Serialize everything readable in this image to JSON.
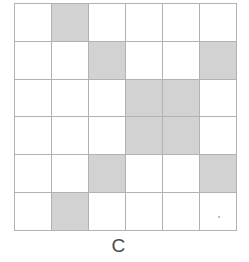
{
  "figure": {
    "caption": "C",
    "type": "shaded-grid",
    "rows": 6,
    "columns": 6,
    "colors": {
      "shaded_cell": "#d2d2d2",
      "empty_cell": "#ffffff",
      "grid_line": "#b2b2b2",
      "caption_text": "#4a4a4a",
      "background": "#ffffff"
    },
    "shaded_count": 10,
    "grid": [
      [
        0,
        1,
        0,
        0,
        0,
        0
      ],
      [
        0,
        0,
        1,
        0,
        0,
        1
      ],
      [
        0,
        0,
        0,
        1,
        1,
        0
      ],
      [
        0,
        0,
        0,
        1,
        1,
        0
      ],
      [
        0,
        0,
        1,
        0,
        0,
        1
      ],
      [
        0,
        1,
        0,
        0,
        0,
        0
      ]
    ],
    "cell_names": [
      [
        "cell-r1c1",
        "cell-r1c2",
        "cell-r1c3",
        "cell-r1c4",
        "cell-r1c5",
        "cell-r1c6"
      ],
      [
        "cell-r2c1",
        "cell-r2c2",
        "cell-r2c3",
        "cell-r2c4",
        "cell-r2c5",
        "cell-r2c6"
      ],
      [
        "cell-r3c1",
        "cell-r3c2",
        "cell-r3c3",
        "cell-r3c4",
        "cell-r3c5",
        "cell-r3c6"
      ],
      [
        "cell-r4c1",
        "cell-r4c2",
        "cell-r4c3",
        "cell-r4c4",
        "cell-r4c5",
        "cell-r4c6"
      ],
      [
        "cell-r5c1",
        "cell-r5c2",
        "cell-r5c3",
        "cell-r5c4",
        "cell-r5c5",
        "cell-r5c6"
      ],
      [
        "cell-r6c1",
        "cell-r6c2",
        "cell-r6c3",
        "cell-r6c4",
        "cell-r6c5",
        "cell-r6c6"
      ]
    ]
  }
}
